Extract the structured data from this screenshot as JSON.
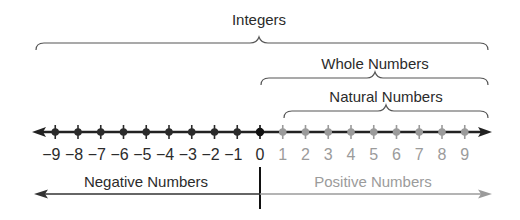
{
  "diagram": {
    "braces": {
      "integers": {
        "label": "Integers"
      },
      "whole": {
        "label": "Whole Numbers"
      },
      "natural": {
        "label": "Natural Numbers"
      }
    },
    "ticks": [
      {
        "value": "−9",
        "n": -9
      },
      {
        "value": "−8",
        "n": -8
      },
      {
        "value": "−7",
        "n": -7
      },
      {
        "value": "−6",
        "n": -6
      },
      {
        "value": "−5",
        "n": -5
      },
      {
        "value": "−4",
        "n": -4
      },
      {
        "value": "−3",
        "n": -3
      },
      {
        "value": "−2",
        "n": -2
      },
      {
        "value": "−1",
        "n": -1
      },
      {
        "value": "0",
        "n": 0
      },
      {
        "value": "1",
        "n": 1
      },
      {
        "value": "2",
        "n": 2
      },
      {
        "value": "3",
        "n": 3
      },
      {
        "value": "4",
        "n": 4
      },
      {
        "value": "5",
        "n": 5
      },
      {
        "value": "6",
        "n": 6
      },
      {
        "value": "7",
        "n": 7
      },
      {
        "value": "8",
        "n": 8
      },
      {
        "value": "9",
        "n": 9
      }
    ],
    "regions": {
      "negative": {
        "label": "Negative Numbers"
      },
      "positive": {
        "label": "Positive Numbers"
      }
    },
    "colors": {
      "dark": "#2b2b2b",
      "zero": "#111111",
      "positive": "#9b9b9b",
      "brace": "#444444"
    }
  }
}
